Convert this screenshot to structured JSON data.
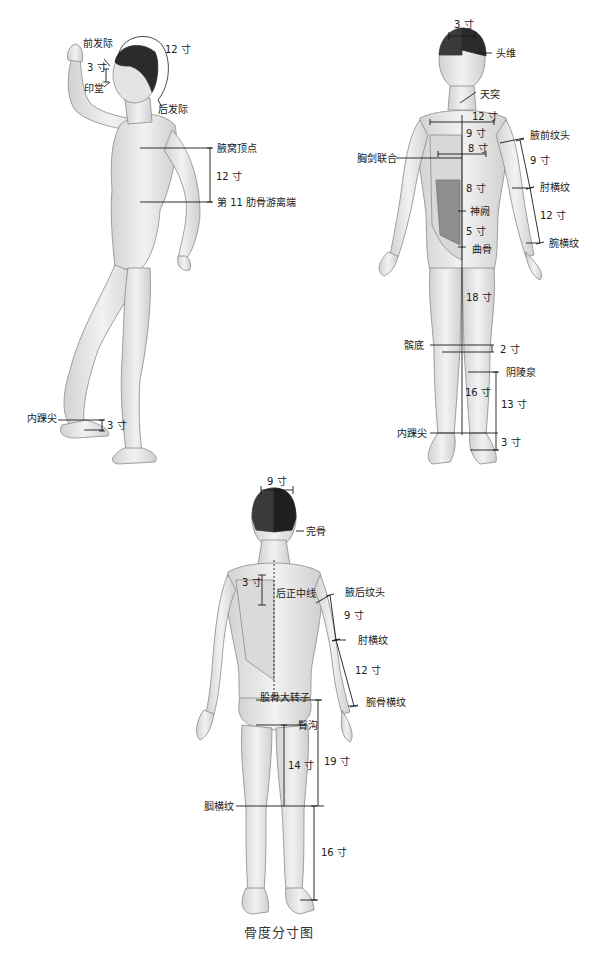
{
  "title": "骨度分寸图",
  "side_figure": {
    "labels": {
      "front_hairline": "前发际",
      "yintang": "印堂",
      "back_hairline": "后发际",
      "head_arc": "12 寸",
      "brow_to_hairline": "3 寸",
      "axilla_apex": "腋窝顶点",
      "axilla_to_rib": "12 寸",
      "rib11_free_end": "第 11 肋骨游离端",
      "medial_malleolus": "内踝尖",
      "malleolus_to_sole": "3 寸"
    }
  },
  "front_figure": {
    "labels": {
      "head_width": "3 寸",
      "touwei": "头维",
      "tiantu": "天突",
      "shoulder_width": "12 寸",
      "tiantu_to_sternum": "9 寸",
      "nipple_width": "8 寸",
      "xiphisternal": "胸剑联合",
      "sternum_to_navel": "8 寸",
      "shenque": "神阙",
      "navel_to_pubis": "5 寸",
      "qugu": "曲骨",
      "anterior_axillary_fold": "腋前纹头",
      "axilla_to_elbow": "9 寸",
      "elbow_crease": "肘横纹",
      "elbow_to_wrist": "12 寸",
      "wrist_crease": "腕横纹",
      "pubis_to_knee": "18 寸",
      "patella_base": "髌底",
      "patella": "2 寸",
      "yinlingquan": "阴陵泉",
      "knee_to_malleolus": "16 寸",
      "yinlingquan_to_malleolus": "13 寸",
      "medial_malleolus": "内踝尖",
      "malleolus_to_sole": "3 寸"
    }
  },
  "back_figure": {
    "labels": {
      "mastoid_width": "9 寸",
      "wangu": "完骨",
      "scapula": "3 寸",
      "posterior_midline": "后正中线",
      "posterior_axillary_fold": "腋后纹头",
      "axilla_to_elbow": "9 寸",
      "elbow_crease": "肘横纹",
      "elbow_to_wrist": "12 寸",
      "wrist_crease": "腕骨横纹",
      "greater_trochanter": "股骨大转子",
      "gluteal_fold": "臀沟",
      "gluteal_to_knee": "14 寸",
      "trochanter_to_knee": "19 寸",
      "popliteal_crease": "腘横纹",
      "knee_to_ankle": "16 寸"
    }
  },
  "colors": {
    "line": "#1a1a1a",
    "skin": "#ececec",
    "skin_shade": "#c9c9c9",
    "hair": "#2b2b2b",
    "bg": "#ffffff"
  }
}
